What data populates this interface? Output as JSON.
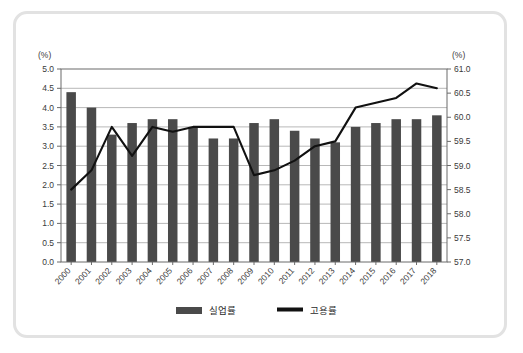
{
  "chart_data": {
    "type": "bar",
    "title": "",
    "subtitle": "",
    "xlabel": "",
    "ylabel": "(%)",
    "y2label": "(%)",
    "grid": true,
    "legend_position": "bottom",
    "categories": [
      "2000",
      "2001",
      "2002",
      "2003",
      "2004",
      "2005",
      "2006",
      "2007",
      "2008",
      "2009",
      "2010",
      "2011",
      "2012",
      "2013",
      "2014",
      "2015",
      "2016",
      "2017",
      "2018"
    ],
    "ylim": [
      0.0,
      5.0
    ],
    "y2lim": [
      57.0,
      61.0
    ],
    "yticks": [
      "0.0",
      "0.5",
      "1.0",
      "1.5",
      "2.0",
      "2.5",
      "3.0",
      "3.5",
      "4.0",
      "4.5",
      "5.0"
    ],
    "y2ticks": [
      "57.0",
      "57.5",
      "58.0",
      "58.5",
      "59.0",
      "59.5",
      "60.0",
      "60.5",
      "61.0"
    ],
    "series": [
      {
        "name": "실업률",
        "type": "bar",
        "axis": "left",
        "color": "#4a4a4a",
        "values": [
          4.4,
          4.0,
          3.3,
          3.6,
          3.7,
          3.7,
          3.5,
          3.2,
          3.2,
          3.6,
          3.7,
          3.4,
          3.2,
          3.1,
          3.5,
          3.6,
          3.7,
          3.7,
          3.8
        ]
      },
      {
        "name": "고용률",
        "type": "line",
        "axis": "right",
        "color": "#111111",
        "values": [
          58.5,
          58.9,
          59.8,
          59.2,
          59.8,
          59.7,
          59.8,
          59.8,
          59.8,
          58.8,
          58.9,
          59.1,
          59.4,
          59.5,
          60.2,
          60.3,
          60.4,
          60.7,
          60.6
        ]
      }
    ],
    "legend": [
      {
        "label": "실업률",
        "marker": "bar",
        "color": "#4a4a4a"
      },
      {
        "label": "고용률",
        "marker": "line",
        "color": "#111111"
      }
    ]
  }
}
